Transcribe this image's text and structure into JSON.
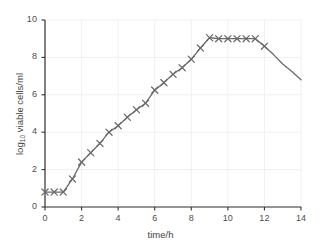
{
  "chart_data": {
    "type": "line",
    "title": "",
    "xlabel": "time/h",
    "ylabel_main": "log",
    "ylabel_sub": "10",
    "ylabel_rest": " viable cells/ml",
    "xlim": [
      0,
      14
    ],
    "ylim": [
      0,
      10
    ],
    "xticks": [
      0,
      2,
      4,
      6,
      8,
      10,
      12,
      14
    ],
    "yticks": [
      0,
      2,
      4,
      6,
      8,
      10
    ],
    "grid": true,
    "legend": false,
    "marker": "x",
    "line_color": "#6a6a6a",
    "grid_color": "#f0f0f0",
    "axis_color": "#333333",
    "series": [
      {
        "name": "viable cell count",
        "x": [
          0,
          0.5,
          1,
          1.5,
          2,
          2.5,
          3,
          3.5,
          4,
          4.5,
          5,
          5.5,
          6,
          6.5,
          7,
          7.5,
          8,
          8.5,
          9,
          9.5,
          10,
          10.5,
          11,
          11.5,
          12,
          12.5,
          13,
          13.5,
          14
        ],
        "y": [
          0.8,
          0.8,
          0.8,
          1.5,
          2.4,
          2.9,
          3.4,
          4.0,
          4.35,
          4.8,
          5.2,
          5.55,
          6.25,
          6.65,
          7.1,
          7.45,
          7.9,
          8.5,
          9.05,
          9.0,
          9.0,
          9.0,
          9.0,
          9.0,
          8.6,
          8.15,
          7.65,
          7.25,
          6.8
        ],
        "marker_x": [
          0,
          0.5,
          1,
          1.5,
          2,
          2.5,
          3,
          3.5,
          4,
          4.5,
          5,
          5.5,
          6,
          6.5,
          7,
          7.5,
          8,
          8.5,
          9,
          9.5,
          10,
          10.5,
          11,
          11.5,
          12
        ],
        "marker_y": [
          0.8,
          0.8,
          0.8,
          1.5,
          2.4,
          2.9,
          3.4,
          4.0,
          4.35,
          4.8,
          5.2,
          5.55,
          6.25,
          6.65,
          7.1,
          7.45,
          7.9,
          8.5,
          9.05,
          9.0,
          9.0,
          9.0,
          9.0,
          9.0,
          8.6
        ]
      }
    ]
  }
}
